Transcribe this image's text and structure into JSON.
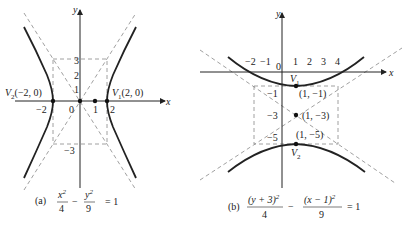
{
  "figure_a": {
    "label": "(a)",
    "equation": {
      "num1": "x",
      "sup1": "2",
      "den1": "4",
      "minus": "−",
      "num2": "y",
      "sup2": "2",
      "den2": "9",
      "rhs": "= 1"
    },
    "axis_x": "x",
    "axis_y": "y",
    "ticks_x": [
      "−2",
      "0",
      "1",
      "2"
    ],
    "ticks_y": [
      "3",
      "2",
      "1",
      "−3"
    ],
    "vertex1": {
      "name": "V",
      "sub": "1",
      "coord": "(2, 0)"
    },
    "vertex2": {
      "name": "V",
      "sub": "2",
      "coord": "(−2, 0)"
    }
  },
  "figure_b": {
    "label": "(b)",
    "equation": {
      "num1": "(y + 3)",
      "sup1": "2",
      "den1": "4",
      "minus": "−",
      "num2": "(x − 1)",
      "sup2": "2",
      "den2": "9",
      "rhs": "= 1"
    },
    "axis_x": "x",
    "axis_y": "y",
    "ticks_x": [
      "−2",
      "−1",
      "0",
      "1",
      "2",
      "3",
      "4"
    ],
    "ticks_y": [
      "−1",
      "−3",
      "−5"
    ],
    "vertex1": {
      "name": "V",
      "sub": "1",
      "coord": "(1, −1)"
    },
    "center": {
      "coord": "(1, −3)"
    },
    "vertex2": {
      "name": "V",
      "sub": "2",
      "coord": "(1, −5)"
    }
  }
}
